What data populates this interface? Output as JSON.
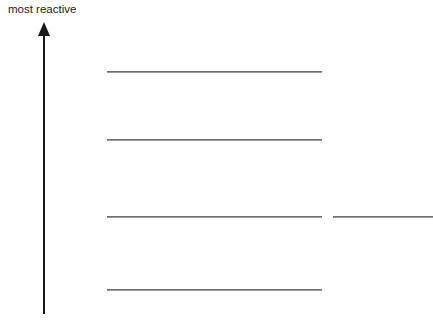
{
  "diagram": {
    "axis_label": "most reactive",
    "axis": {
      "direction": "up",
      "x": 44,
      "top": 22,
      "bottom": 314
    },
    "levels": [
      {
        "id": "level-1",
        "x1": 107,
        "x2": 322,
        "y": 72
      },
      {
        "id": "level-2",
        "x1": 107,
        "x2": 322,
        "y": 140
      },
      {
        "id": "level-3",
        "x1": 107,
        "x2": 322,
        "y": 217
      },
      {
        "id": "level-4",
        "x1": 107,
        "x2": 322,
        "y": 290
      },
      {
        "id": "side-level",
        "x1": 333,
        "x2": 433,
        "y": 217
      }
    ],
    "colors": {
      "arrow": "#1a1a1a",
      "line": "#6e6e6e",
      "background": "#ffffff"
    }
  }
}
